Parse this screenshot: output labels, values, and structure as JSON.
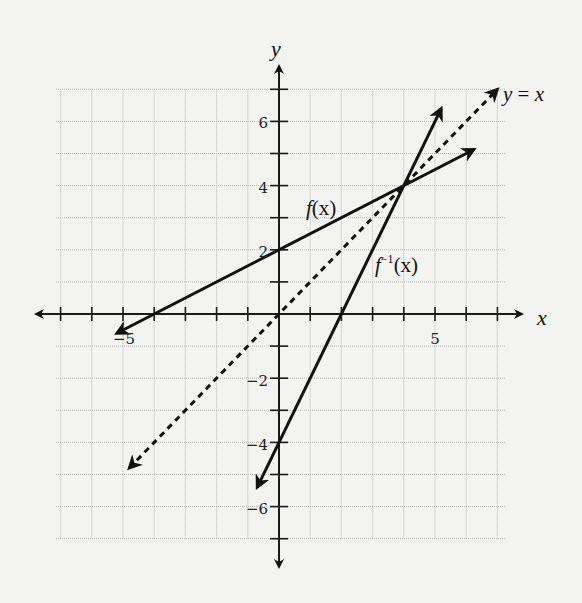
{
  "chart_data": {
    "type": "line",
    "title": "",
    "xlabel": "x",
    "ylabel": "y",
    "xlim": [
      -7.3,
      7.3
    ],
    "ylim": [
      -7,
      7
    ],
    "grid": true,
    "x_tick_labels": [
      {
        "value": -5,
        "label": "−5"
      },
      {
        "value": 5,
        "label": "5"
      }
    ],
    "y_tick_labels": [
      {
        "value": 6,
        "label": "6"
      },
      {
        "value": 4,
        "label": "4"
      },
      {
        "value": 2,
        "label": "2"
      },
      {
        "value": -2,
        "label": "−2"
      },
      {
        "value": -4,
        "label": "−4"
      },
      {
        "value": -6,
        "label": "−6"
      }
    ],
    "series": [
      {
        "name": "f(x)",
        "equation": "y = x/2 + 2",
        "style": "solid",
        "x": [
          -5.2,
          6.25
        ],
        "y": [
          -0.6,
          5.125
        ],
        "label": "f(x)"
      },
      {
        "name": "f^-1(x)",
        "equation": "y = 2x - 4",
        "style": "solid",
        "x": [
          -0.7,
          5.2
        ],
        "y": [
          -5.4,
          6.4
        ],
        "label": "f⁻¹(x)"
      },
      {
        "name": "y = x",
        "equation": "y = x",
        "style": "dashed",
        "x": [
          -4.8,
          7.0
        ],
        "y": [
          -4.8,
          7.0
        ],
        "label": "y = x"
      }
    ],
    "annotations": [
      {
        "text": "f(x)",
        "x": 1.0,
        "y": 3.2
      },
      {
        "text": "f⁻¹(x)",
        "x": 3.0,
        "y": 1.3
      },
      {
        "text": "y = x",
        "x": 7.3,
        "y": 7.0
      }
    ],
    "intersection": {
      "x": 4,
      "y": 4
    }
  },
  "labels": {
    "x_axis": "x",
    "y_axis": "y",
    "f": "f",
    "f_arg": "(x)",
    "finv": "f",
    "finv_sup": "−1",
    "finv_arg": "(x)",
    "yx_y": "y",
    "yx_eq": " = ",
    "yx_x": "x",
    "tick_x_neg5": "−5",
    "tick_x_5": "5",
    "tick_y_6": "6",
    "tick_y_4": "4",
    "tick_y_2": "2",
    "tick_y_neg2": "−2",
    "tick_y_neg4": "−4",
    "tick_y_neg6": "−6"
  }
}
